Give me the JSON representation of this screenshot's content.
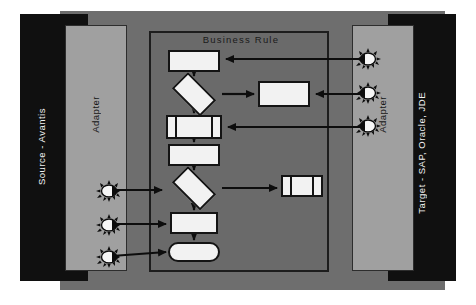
{
  "diagram": {
    "panels": {
      "source_label": "Source - Avantis",
      "source_adapter_label": "Adapter",
      "target_adapter_label": "Adapter",
      "target_label": "Target - SAP, Oracle, JDE",
      "business_rule_label": "Business Rule"
    },
    "colors": {
      "dark_panel": "#101010",
      "mid_slab": "#6e6e6e",
      "adapter_panel": "#a0a0a0",
      "rule_panel": "#6a6a6a",
      "node_fill": "#f2f2f2",
      "stroke": "#141414",
      "page_background": "#ffffff"
    },
    "flow_nodes": [
      {
        "id": "proc1",
        "shape": "process",
        "label": ""
      },
      {
        "id": "dec1",
        "shape": "decision",
        "label": ""
      },
      {
        "id": "predef",
        "shape": "predefined-process",
        "label": ""
      },
      {
        "id": "proc2",
        "shape": "process",
        "label": ""
      },
      {
        "id": "dec2",
        "shape": "decision",
        "label": ""
      },
      {
        "id": "proc3",
        "shape": "process",
        "label": ""
      },
      {
        "id": "term",
        "shape": "terminator",
        "label": ""
      },
      {
        "id": "side1",
        "shape": "process",
        "label": ""
      },
      {
        "id": "side2",
        "shape": "predefined-process",
        "label": ""
      }
    ],
    "connectors": [
      {
        "from": "target-adapter-burst-1",
        "to": "proc1",
        "direction": "left"
      },
      {
        "from": "dec1",
        "to": "side1",
        "direction": "right"
      },
      {
        "from": "target-adapter-burst-2",
        "to": "side1",
        "direction": "left"
      },
      {
        "from": "target-adapter-burst-3",
        "to": "predef",
        "direction": "left"
      },
      {
        "from": "dec2",
        "to": "side2",
        "direction": "right"
      },
      {
        "from": "source-adapter-burst-1",
        "to": "dec2",
        "direction": "right"
      },
      {
        "from": "source-adapter-burst-2",
        "to": "proc3",
        "direction": "right"
      },
      {
        "from": "source-adapter-burst-3",
        "to": "term",
        "direction": "right"
      }
    ],
    "icons": {
      "burst_name": "starburst-icon",
      "source_bursts": 3,
      "target_bursts": 3
    }
  }
}
